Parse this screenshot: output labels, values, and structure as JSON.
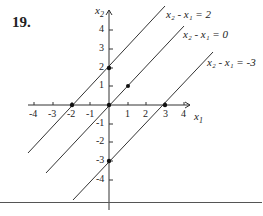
{
  "problem_number": "19.",
  "axes": {
    "x_label": "x",
    "x_sub": "1",
    "y_label": "x",
    "y_sub": "2",
    "x_ticks": [
      "-4",
      "-3",
      "-2",
      "-1",
      "1",
      "2",
      "3",
      "4"
    ],
    "y_ticks": [
      "4",
      "3",
      "2",
      "1",
      "-1",
      "-2",
      "-3",
      "-4"
    ]
  },
  "lines": [
    {
      "label": "x₂ - x₁ = 2"
    },
    {
      "label": "x₂ - x₁ = 0"
    },
    {
      "label": "x₂ - x₁ = -3"
    }
  ],
  "points": [
    "(-2,0)",
    "(0,2)",
    "(0,0)",
    "(1,1)",
    "(3,0)",
    "(0,-3)"
  ]
}
